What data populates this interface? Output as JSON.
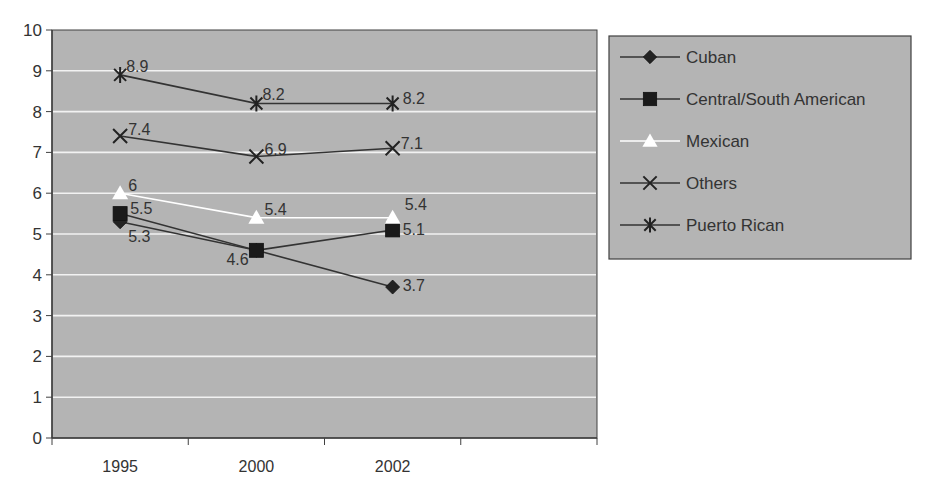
{
  "chart_data": {
    "type": "line",
    "title": "",
    "xlabel": "",
    "ylabel": "",
    "categories": [
      "1995",
      "2000",
      "2002"
    ],
    "category_slots": 4,
    "ylim": [
      0,
      10
    ],
    "yticks": [
      0,
      1,
      2,
      3,
      4,
      5,
      6,
      7,
      8,
      9,
      10
    ],
    "grid": true,
    "legend_position": "right",
    "series": [
      {
        "name": "Cuban",
        "marker": "diamond",
        "line_color": "#333333",
        "marker_color": "#222222",
        "values": [
          5.3,
          4.6,
          3.7
        ],
        "labels": [
          "5.3",
          "",
          "3.7"
        ]
      },
      {
        "name": "Central/South American",
        "marker": "square",
        "line_color": "#333333",
        "marker_color": "#1a1a1a",
        "values": [
          5.5,
          4.6,
          5.1
        ],
        "labels": [
          "5.5",
          "4.6",
          "5.1"
        ]
      },
      {
        "name": "Mexican",
        "marker": "triangle",
        "line_color": "#ffffff",
        "marker_color": "#ffffff",
        "values": [
          6,
          5.4,
          5.4
        ],
        "labels": [
          "6",
          "5.4",
          "5.4"
        ]
      },
      {
        "name": "Others",
        "marker": "x",
        "line_color": "#333333",
        "marker_color": "#222222",
        "values": [
          7.4,
          6.9,
          7.1
        ],
        "labels": [
          "7.4",
          "6.9",
          "7.1"
        ]
      },
      {
        "name": "Puerto Rican",
        "marker": "asterisk",
        "line_color": "#333333",
        "marker_color": "#222222",
        "values": [
          8.9,
          8.2,
          8.2
        ],
        "labels": [
          "8.9",
          "8.2",
          "8.2"
        ]
      }
    ]
  },
  "colors": {
    "plot_background": "#b4b4b4",
    "legend_background": "#b4b4b4",
    "gridline": "#f2f2f2",
    "axis": "#404040",
    "text": "#333333"
  }
}
